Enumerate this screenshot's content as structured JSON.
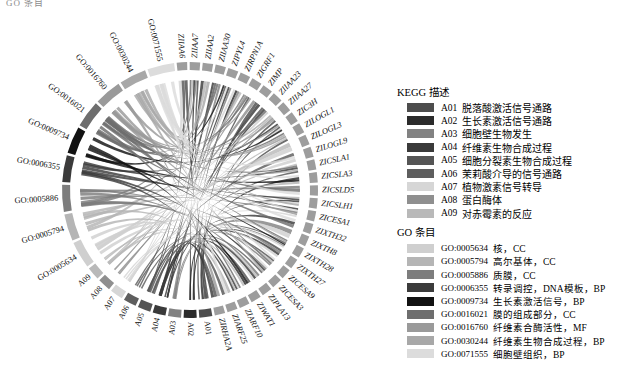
{
  "top_fragment": "GO 条目",
  "chart_data": {
    "type": "chord",
    "title": "",
    "layout": {
      "center_x": 190,
      "center_y": 190,
      "outer_radius": 128,
      "track_radius": 120,
      "ribbon_radius": 110,
      "start_angle_deg": -96,
      "direction": "clockwise",
      "grid": false,
      "legend_position": "right"
    },
    "gene_sectors": [
      "ZIIAA6",
      "ZIMP",
      "ZIIAA23",
      "ZIIAA27",
      "ZIC3H",
      "ZILOGL1",
      "ZILOGL3",
      "ZILOGL9",
      "ZICSLA1",
      "ZICSLA3",
      "ZICSLD5",
      "ZICSLH1",
      "ZICESA1",
      "ZIXTH32",
      "ZIXTH8",
      "ZIXTH28",
      "ZIXTH27",
      "ZICESA9",
      "ZICESA3",
      "ZIPLA13",
      "ZIWAT1",
      "ZIARF10",
      "ZIARF25",
      "ZIRHA2A"
    ],
    "gene_sectors_top": [
      "ZIIAA6",
      "ZIIAA7",
      "ZIIAA2",
      "ZIIAA30",
      "ZIPYL4",
      "ZIRPN1A",
      "ZIGRF1"
    ],
    "kegg_sectors": [
      "A01",
      "A02",
      "A03",
      "A04",
      "A05",
      "A06",
      "A07",
      "A08",
      "A09"
    ],
    "go_sectors": [
      "GO:0005634",
      "GO:0005794",
      "GO:0005886",
      "GO:0006355",
      "GO:0009734",
      "GO:0016021",
      "GO:0016760",
      "GO:0030244",
      "GO:0071555"
    ]
  },
  "kegg_legend": {
    "title": "KEGG 描述",
    "items": [
      {
        "code": "A01",
        "desc": "脱落酸激活信号通路",
        "color": "#4d4d4d"
      },
      {
        "code": "A02",
        "desc": "生长素激活信号通路",
        "color": "#2b2b2b"
      },
      {
        "code": "A03",
        "desc": "细胞壁生物发生",
        "color": "#828282"
      },
      {
        "code": "A04",
        "desc": "纤维素生物合成过程",
        "color": "#3a3a3a"
      },
      {
        "code": "A05",
        "desc": "细胞分裂素生物合成过程",
        "color": "#555555"
      },
      {
        "code": "A06",
        "desc": "茉莉酸介导的信号通路",
        "color": "#5e5e5e"
      },
      {
        "code": "A07",
        "desc": "植物激素信号转导",
        "color": "#d6d6d6"
      },
      {
        "code": "A08",
        "desc": "蛋白酶体",
        "color": "#8f8f8f"
      },
      {
        "code": "A09",
        "desc": "对赤霉素的反应",
        "color": "#b9b9b9"
      }
    ]
  },
  "go_legend": {
    "title": "GO 条目",
    "items": [
      {
        "code": "GO:0005634",
        "desc": "核，CC",
        "color": "#cfcfcf"
      },
      {
        "code": "GO:0005794",
        "desc": "高尔基体，CC",
        "color": "#b5b5b5"
      },
      {
        "code": "GO:0005886",
        "desc": "质膜，CC",
        "color": "#7d7d7d"
      },
      {
        "code": "GO:0006355",
        "desc": "转录调控，DNA模板，BP",
        "color": "#3b3b3b"
      },
      {
        "code": "GO:0009734",
        "desc": "生长素激活信号，BP",
        "color": "#121212"
      },
      {
        "code": "GO:0016021",
        "desc": "膜的组成部分，CC",
        "color": "#6e6e6e"
      },
      {
        "code": "GO:0016760",
        "desc": "纤维素合酶活性，MF",
        "color": "#9a9a9a"
      },
      {
        "code": "GO:0030244",
        "desc": "纤维素生物合成过程，BP",
        "color": "#a8a8a8"
      },
      {
        "code": "GO:0071555",
        "desc": "细胞壁组织，BP",
        "color": "#dcdcdc"
      }
    ]
  }
}
